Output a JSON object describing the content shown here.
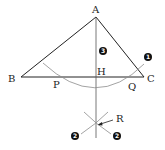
{
  "diagram": {
    "type": "geometric-construction",
    "colors": {
      "line": "#222222",
      "construction": "#8c8c8c",
      "marker_fill": "#111111",
      "marker_text": "#ffffff"
    },
    "points": {
      "A": {
        "label": "A",
        "x": 96,
        "y": 17
      },
      "B": {
        "label": "B",
        "x": 21,
        "y": 77
      },
      "C": {
        "label": "C",
        "x": 144,
        "y": 77
      },
      "H": {
        "label": "H",
        "x": 96,
        "y": 77
      },
      "P": {
        "label": "P",
        "x": 55,
        "y": 77
      },
      "Q": {
        "label": "Q",
        "x": 137,
        "y": 77
      },
      "R": {
        "label": "R",
        "x": 96,
        "y": 125
      }
    },
    "labels": {
      "A": "A",
      "B": "B",
      "C": "C",
      "H": "H",
      "P": "P",
      "Q": "Q",
      "R": "R"
    },
    "step_markers": [
      {
        "number": "1",
        "x": 148,
        "y": 57
      },
      {
        "number": "2",
        "x": 75,
        "y": 136
      },
      {
        "number": "2",
        "x": 117,
        "y": 136
      },
      {
        "number": "3",
        "x": 103,
        "y": 51
      }
    ]
  }
}
